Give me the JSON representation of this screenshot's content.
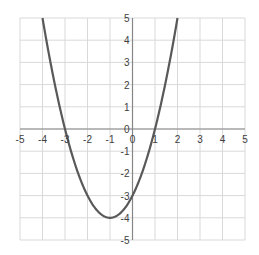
{
  "chart_data": {
    "type": "line",
    "title": "",
    "xlabel": "",
    "ylabel": "",
    "function": "y = x^2 + 2x - 3",
    "xlim": [
      -5,
      5
    ],
    "ylim": [
      -5,
      5
    ],
    "grid": true,
    "legend": null,
    "x_ticks": [
      -5,
      -4,
      -3,
      -2,
      -1,
      0,
      1,
      2,
      3,
      4,
      5
    ],
    "y_ticks": [
      -5,
      -4,
      -3,
      -2,
      -1,
      0,
      1,
      2,
      3,
      4,
      5
    ],
    "x_tick_labels": [
      "-5",
      "-4",
      "-3",
      "-2",
      "-1",
      "0",
      "1",
      "2",
      "3",
      "4",
      "5"
    ],
    "y_tick_labels": [
      "-5",
      "-4",
      "-3",
      "-2",
      "-1",
      "0",
      "1",
      "2",
      "3",
      "4",
      "5"
    ],
    "series": [
      {
        "name": "parabola",
        "color": "#595959",
        "x": [
          -4,
          -3.5,
          -3,
          -2.5,
          -2,
          -1.5,
          -1,
          -0.5,
          0,
          0.5,
          1,
          1.5,
          2
        ],
        "y": [
          5,
          1.25,
          0,
          -1.75,
          -3,
          -3.75,
          -4,
          -3.75,
          -3,
          -1.75,
          0,
          2.25,
          5
        ]
      }
    ],
    "annotations": {
      "roots": [
        -3,
        1
      ],
      "vertex": [
        -1,
        -4
      ],
      "y_intercept": -3
    }
  },
  "colors": {
    "grid": "#d9d9d9",
    "axis": "#868686",
    "curve": "#595959",
    "label": "#404040"
  }
}
